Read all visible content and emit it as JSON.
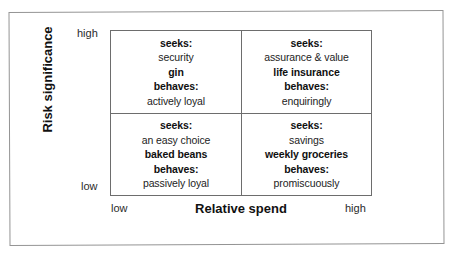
{
  "figure": {
    "kind": "two-by-two-matrix",
    "frame_color": "#949494",
    "grid_color": "#6d6d6d",
    "text_color": "#232323"
  },
  "axes": {
    "y": {
      "title": "Risk significance",
      "high_label": "high",
      "low_label": "low"
    },
    "x": {
      "title": "Relative spend",
      "low_label": "low",
      "high_label": "high"
    }
  },
  "quadrants": {
    "top_left": {
      "seeks_label": "seeks:",
      "seeks_value": "security",
      "product": "gin",
      "behaves_label": "behaves:",
      "behaves_value": "actively loyal"
    },
    "top_right": {
      "seeks_label": "seeks:",
      "seeks_value": "assurance & value",
      "product": "life insurance",
      "behaves_label": "behaves:",
      "behaves_value": "enquiringly"
    },
    "bottom_left": {
      "seeks_label": "seeks:",
      "seeks_value": "an easy choice",
      "product": "baked beans",
      "behaves_label": "behaves:",
      "behaves_value": "passively loyal"
    },
    "bottom_right": {
      "seeks_label": "seeks:",
      "seeks_value": "savings",
      "product": "weekly groceries",
      "behaves_label": "behaves:",
      "behaves_value": "promiscuously"
    }
  }
}
